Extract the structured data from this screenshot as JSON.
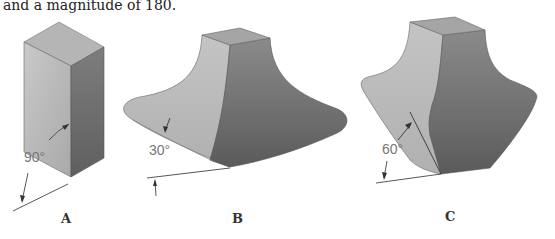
{
  "caption": "and a magnitude of 180.",
  "figures": [
    {
      "id": "A",
      "label": "A",
      "angle_label": "90°",
      "angle": 90
    },
    {
      "id": "B",
      "label": "B",
      "angle_label": "30°",
      "angle": 30
    },
    {
      "id": "C",
      "label": "C",
      "angle_label": "60°",
      "angle": 60
    }
  ],
  "colors": {
    "light_face": "#bdbdbd",
    "top_face": "#a8a8a8",
    "dark_face": "#6e6e6e",
    "line": "#555555"
  }
}
